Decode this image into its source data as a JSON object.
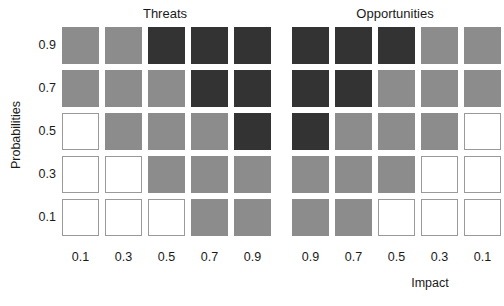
{
  "chart_data": {
    "type": "heatmap",
    "title": "",
    "xlabel": "Impact",
    "ylabel": "Probabilities",
    "legend_position": "none",
    "grid": false,
    "probabilities": [
      "0.9",
      "0.7",
      "0.5",
      "0.3",
      "0.1"
    ],
    "severity_levels": {
      "low": "#ffffff",
      "medium": "#8c8c8c",
      "high": "#333333"
    },
    "panels": [
      {
        "name": "Threats",
        "impacts": [
          "0.1",
          "0.3",
          "0.5",
          "0.7",
          "0.9"
        ],
        "rows": [
          {
            "probability": "0.9",
            "cells": [
              "medium",
              "medium",
              "high",
              "high",
              "high"
            ]
          },
          {
            "probability": "0.7",
            "cells": [
              "medium",
              "medium",
              "medium",
              "high",
              "high"
            ]
          },
          {
            "probability": "0.5",
            "cells": [
              "low",
              "medium",
              "medium",
              "medium",
              "high"
            ]
          },
          {
            "probability": "0.3",
            "cells": [
              "low",
              "low",
              "medium",
              "medium",
              "medium"
            ]
          },
          {
            "probability": "0.1",
            "cells": [
              "low",
              "low",
              "low",
              "medium",
              "medium"
            ]
          }
        ]
      },
      {
        "name": "Opportunities",
        "impacts": [
          "0.9",
          "0.7",
          "0.5",
          "0.3",
          "0.1"
        ],
        "rows": [
          {
            "probability": "0.9",
            "cells": [
              "high",
              "high",
              "high",
              "medium",
              "medium"
            ]
          },
          {
            "probability": "0.7",
            "cells": [
              "high",
              "high",
              "medium",
              "medium",
              "medium"
            ]
          },
          {
            "probability": "0.5",
            "cells": [
              "high",
              "medium",
              "medium",
              "medium",
              "low"
            ]
          },
          {
            "probability": "0.3",
            "cells": [
              "medium",
              "medium",
              "medium",
              "low",
              "low"
            ]
          },
          {
            "probability": "0.1",
            "cells": [
              "medium",
              "medium",
              "low",
              "low",
              "low"
            ]
          }
        ]
      }
    ]
  },
  "axes": {
    "y_title": "Probabilities",
    "x_title": "Impact"
  },
  "layout": {
    "cell_size": 37,
    "cell_pitch": 43,
    "panel_left_threats": 62,
    "panel_left_opportunities": 292,
    "grid_top": 27
  }
}
